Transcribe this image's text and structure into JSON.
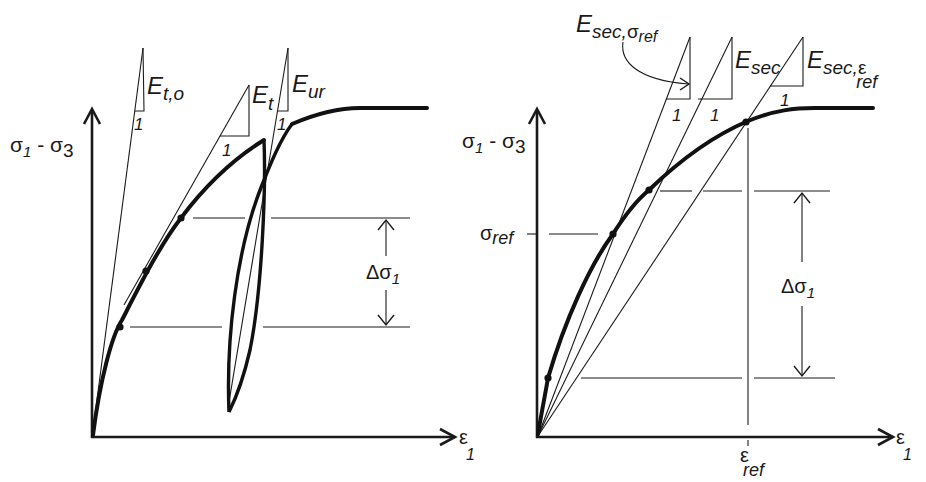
{
  "figure": {
    "left_panel": {
      "y_axis_label": {
        "main": "σ",
        "sub1": "1",
        "mid": " - σ",
        "sub2": "3"
      },
      "x_axis_label": {
        "main": "ε",
        "sub": "1"
      },
      "moduli": [
        {
          "id": "initial-tangent",
          "symbol": "E",
          "subscript": "t,o",
          "unit_label": "1"
        },
        {
          "id": "tangent",
          "symbol": "E",
          "subscript": "t",
          "unit_label": "1"
        },
        {
          "id": "unload-reload",
          "symbol": "E",
          "subscript": "ur",
          "unit_label": "1"
        }
      ],
      "delta_label": {
        "main": "Δσ",
        "sub": "1"
      }
    },
    "right_panel": {
      "y_axis_label": {
        "main": "σ",
        "sub1": "1",
        "mid": " - σ",
        "sub2": "3"
      },
      "x_axis_label": {
        "main": "ε",
        "sub": "1"
      },
      "y_tick_label": {
        "main": "σ",
        "sub": "ref"
      },
      "x_tick_label": {
        "main": "ε",
        "sub": "ref"
      },
      "moduli": [
        {
          "id": "secant-sigma-ref",
          "symbol": "E",
          "subscript": "sec,",
          "subsub_main": "σ",
          "subsub": "ref",
          "unit_label": "1"
        },
        {
          "id": "secant",
          "symbol": "E",
          "subscript": "sec",
          "unit_label": "1"
        },
        {
          "id": "secant-eps-ref",
          "symbol": "E",
          "subscript": "sec,",
          "subsub_main": "ε",
          "subsub": "ref",
          "unit_label": "1"
        }
      ],
      "delta_label": {
        "main": "Δσ",
        "sub": "1"
      }
    }
  },
  "colors": {
    "ink": "#1a1a1a",
    "background": "#ffffff"
  }
}
